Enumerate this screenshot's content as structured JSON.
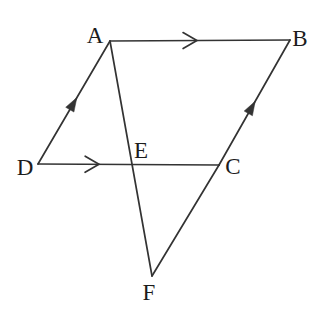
{
  "figure": {
    "background_color": "#ffffff",
    "line_color": "#333333",
    "label_color": "#1c1c1c",
    "line_width": 1.7,
    "points": {
      "A": {
        "label": "A",
        "x": 110,
        "y": 41,
        "label_x": 95,
        "label_y": 43
      },
      "B": {
        "label": "B",
        "x": 290,
        "y": 40,
        "label_x": 300,
        "label_y": 46
      },
      "C": {
        "label": "C",
        "x": 219,
        "y": 165,
        "label_x": 233,
        "label_y": 174
      },
      "D": {
        "label": "D",
        "x": 38,
        "y": 164,
        "label_x": 25,
        "label_y": 175
      },
      "E": {
        "label": "E",
        "x": 131,
        "y": 164,
        "label_x": 141,
        "label_y": 158
      },
      "F": {
        "label": "F",
        "x": 152,
        "y": 276,
        "label_x": 149,
        "label_y": 300
      }
    },
    "segments": [
      {
        "from": "A",
        "to": "B",
        "marker": "chevron",
        "marker_t": 0.483
      },
      {
        "from": "D",
        "to": "A",
        "marker": "solid",
        "marker_t": 0.54
      },
      {
        "from": "D",
        "to": "C",
        "marker": "chevron",
        "marker_t": 0.337
      },
      {
        "from": "C",
        "to": "B",
        "marker": "solid",
        "marker_t": 0.51
      },
      {
        "from": "A",
        "to": "F",
        "marker": "none",
        "marker_t": 0
      },
      {
        "from": "F",
        "to": "C",
        "marker": "none",
        "marker_t": 0
      }
    ],
    "marker_style": {
      "chevron_arm_length": 16,
      "chevron_angle_deg": 30,
      "solid_length": 14,
      "solid_width": 9.5
    }
  }
}
